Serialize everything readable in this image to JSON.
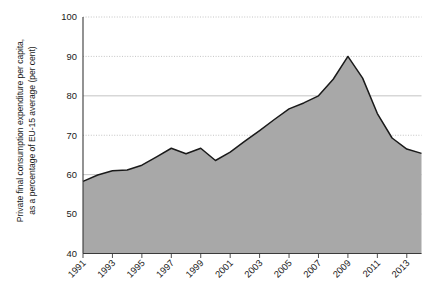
{
  "chart_data": {
    "type": "area",
    "title": "",
    "subtitle": "",
    "xlabel": "",
    "ylabel_line1": "Private final consumption expenditure per capita,",
    "ylabel_line2": "as a percentage of EU-15 average (per cent)",
    "ylim": [
      40,
      100
    ],
    "xlim": [
      1991,
      2014
    ],
    "ytick_labels": [
      "100",
      "90",
      "80",
      "70",
      "60",
      "50",
      "40"
    ],
    "ytick_values": [
      100,
      90,
      80,
      70,
      60,
      50,
      40
    ],
    "xtick_labels": [
      "1991",
      "1993",
      "1995",
      "1997",
      "1999",
      "2001",
      "2003",
      "2005",
      "2007",
      "2009",
      "2011",
      "2013"
    ],
    "xtick_values": [
      1991,
      1993,
      1995,
      1997,
      1999,
      2001,
      2003,
      2005,
      2007,
      2009,
      2011,
      2013
    ],
    "grid": true,
    "grid_axis": "y",
    "legend": null,
    "legend_position": "none",
    "series_name": "Private final consumption expenditure per capita",
    "x": [
      1991,
      1992,
      1993,
      1994,
      1995,
      1996,
      1997,
      1998,
      1999,
      2000,
      2001,
      2002,
      2003,
      2004,
      2005,
      2006,
      2007,
      2008,
      2009,
      2010,
      2011,
      2012,
      2013,
      2014
    ],
    "values": [
      58.3,
      59.9,
      61.0,
      61.2,
      62.4,
      64.5,
      66.7,
      65.3,
      66.7,
      63.6,
      65.7,
      68.5,
      71.2,
      74.0,
      76.7,
      78.2,
      80.0,
      84.2,
      90.0,
      84.5,
      75.5,
      69.3,
      66.5,
      65.4
    ],
    "fill_color": "#a8a8a8",
    "line_color": "#1a1a1a",
    "grid_color": "#b5b5b5",
    "axis_color": "#3a3a3a",
    "background_color": "#ffffff"
  }
}
